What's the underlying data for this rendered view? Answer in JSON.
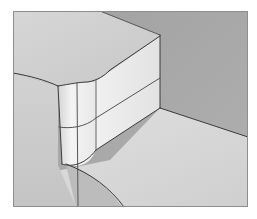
{
  "figure": {
    "description": "Shaded 3D render of a rectangular block with a rounded (filleted) vertical corner edge sitting on a plane, viewed in a framed viewport",
    "frame": {
      "x": 13,
      "y": 11,
      "width": 235,
      "height": 196
    },
    "colors": {
      "background": "#ffffff",
      "top_face": "#cfcfcf",
      "front_face_light": "#ececec",
      "side_face": "#e6e6e6",
      "back_wall": "#a9a9a9",
      "floor_left": "#c9c9c9",
      "floor_right": "#d8d8d8",
      "floor_shadow": "#bdbdbd",
      "edge_line": "#3a3a3a",
      "frame_border": "#8e8e8e"
    }
  }
}
